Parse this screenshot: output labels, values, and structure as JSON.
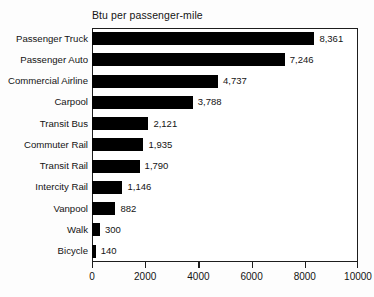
{
  "chart_data": {
    "type": "bar",
    "orientation": "horizontal",
    "title": "Btu per passenger-mile",
    "xlabel": "",
    "ylabel": "",
    "xlim": [
      0,
      10000
    ],
    "xticks": [
      0,
      2000,
      4000,
      6000,
      8000,
      10000
    ],
    "xtick_labels": [
      "0",
      "2000",
      "4000",
      "6000",
      "8000",
      "10000"
    ],
    "grid": false,
    "legend": false,
    "bar_color": "#000000",
    "frame_color": "#1d1d1d",
    "background_color": "#ffffff",
    "categories": [
      "Passenger Truck",
      "Passenger Auto",
      "Commercial Airline",
      "Carpool",
      "Transit Bus",
      "Commuter Rail",
      "Transit Rail",
      "Intercity Rail",
      "Vanpool",
      "Walk",
      "Bicycle"
    ],
    "values": [
      8361,
      7246,
      4737,
      3788,
      2121,
      1935,
      1790,
      1146,
      882,
      300,
      140
    ],
    "value_labels": [
      "8,361",
      "7,246",
      "4,737",
      "3,788",
      "2,121",
      "1,935",
      "1,790",
      "1,146",
      "882",
      "300",
      "140"
    ]
  }
}
